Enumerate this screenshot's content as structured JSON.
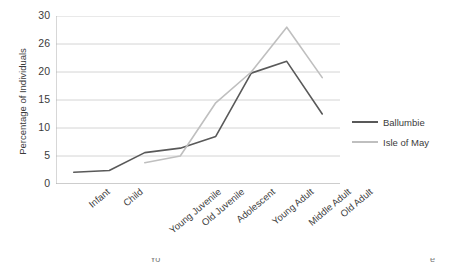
{
  "chart_data": {
    "type": "line",
    "title": "",
    "xlabel": "",
    "ylabel": "Percentage of Individuals",
    "categories": [
      "Infant",
      "Child",
      "Young Juvenile",
      "Old Juvenile",
      "Adolescent",
      "Young Adult",
      "Middle Adult",
      "Old Adult"
    ],
    "series": [
      {
        "name": "Ballumbie",
        "color": "#595959",
        "values": [
          2.1,
          2.4,
          5.6,
          6.4,
          8.5,
          19.8,
          21.9,
          12.5
        ]
      },
      {
        "name": "Isle of May",
        "color": "#bfbfbf",
        "values": [
          null,
          null,
          3.8,
          5.0,
          14.5,
          20.0,
          28.0,
          19.0
        ]
      }
    ],
    "ylim": [
      0,
      30
    ],
    "ytick_labels": [
      "0",
      "5",
      "10",
      "15",
      "20",
      "26",
      "30"
    ],
    "ytick_values": [
      0,
      5,
      10,
      15,
      20,
      25,
      30
    ],
    "grid": true,
    "legend_position": "right"
  },
  "legend": {
    "entries": [
      {
        "label": "Ballumbie",
        "color": "#595959"
      },
      {
        "label": "Isle of May",
        "color": "#bfbfbf"
      }
    ]
  },
  "bottom_crop": {
    "fragments": [
      "Yo",
      "e"
    ]
  }
}
